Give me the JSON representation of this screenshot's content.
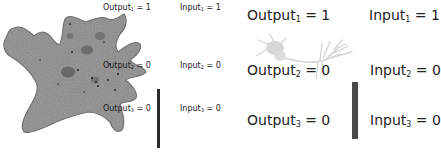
{
  "panels": [
    {
      "name": "amoeba-panel",
      "image": "amoeba-cell",
      "bar_color": "#2a2a2a",
      "rows": [
        {
          "output_label": "Output",
          "output_sub": "1",
          "output_value": "= 1",
          "input_label": "Input",
          "input_sub": "1",
          "input_value": "= 1"
        },
        {
          "output_label": "Output",
          "output_sub": "2",
          "output_value": "= 0",
          "input_label": "Input",
          "input_sub": "2",
          "input_value": "= 0"
        },
        {
          "output_label": "Output",
          "output_sub": "3",
          "output_value": "= 0",
          "input_label": "Input",
          "input_sub": "3",
          "input_value": "= 0"
        }
      ]
    },
    {
      "name": "neuron-panel",
      "image": "neuron-cell",
      "bar_color": "#4a4a4a",
      "rows": [
        {
          "output_label": "Output",
          "output_sub": "1",
          "output_value": "= 1",
          "input_label": "Input",
          "input_sub": "1",
          "input_value": "= 1"
        },
        {
          "output_label": "Output",
          "output_sub": "2",
          "output_value": "= 0",
          "input_label": "Input",
          "input_sub": "2",
          "input_value": "= 0"
        },
        {
          "output_label": "Output",
          "output_sub": "3",
          "output_value": "= 0",
          "input_label": "Input",
          "input_sub": "3",
          "input_value": "= 0"
        }
      ]
    }
  ]
}
